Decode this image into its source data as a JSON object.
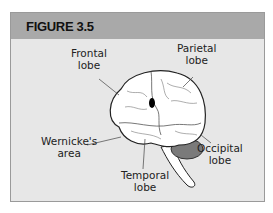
{
  "figure": {
    "title": "FIGURE 3.5",
    "colors": {
      "header_bg": "#a9a9a9",
      "body_bg": "#e7e7e7",
      "border": "#9a9a9a",
      "cerebellum": "#7a7a7a"
    },
    "labels": {
      "frontal": [
        "Frontal",
        "lobe"
      ],
      "parietal": [
        "Parietal",
        "lobe"
      ],
      "wernicke": [
        "Wernicke's",
        "area"
      ],
      "occipital": [
        "Occipital",
        "lobe"
      ],
      "temporal": [
        "Temporal",
        "lobe"
      ]
    }
  }
}
